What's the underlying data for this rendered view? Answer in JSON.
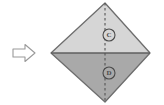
{
  "figure": {
    "background_color": "#ffffff",
    "canvas": {
      "width": 164,
      "height": 105
    }
  },
  "step_arrow": {
    "name": "step-arrow",
    "direction": "right",
    "symbol": "⇨",
    "fill_color": "#ffffff",
    "stroke_color": "#9a9a9a",
    "position": {
      "x": 12,
      "y": 44,
      "width": 24,
      "height": 18
    }
  },
  "shape": {
    "name": "diamond",
    "outline_color": "#6e6e6e",
    "vertices": {
      "top": {
        "x": 105,
        "y": 3
      },
      "left": {
        "x": 51,
        "y": 53
      },
      "right": {
        "x": 150,
        "y": 53
      },
      "bottom": {
        "x": 105,
        "y": 102
      }
    },
    "top_half": {
      "name": "upper-triangle",
      "fill_color": "#d6d6d6"
    },
    "bottom_half": {
      "name": "lower-triangle",
      "fill_color": "#a9a9a9"
    },
    "fold_line_horizontal": {
      "name": "horizontal-fold-line",
      "style": "solid",
      "color": "#5f5f5f",
      "y": 53
    },
    "fold_line_vertical": {
      "name": "vertical-center-dashed-line",
      "style": "dashed",
      "color": "#555555",
      "x": 105
    }
  },
  "markers": [
    {
      "id": "marker-upper",
      "label": "C",
      "center": {
        "x": 109,
        "y": 35
      },
      "radius": 6,
      "stroke_color": "#4a4a4a",
      "fill_color": "#d6d6d6"
    },
    {
      "id": "marker-lower",
      "label": "D",
      "center": {
        "x": 109,
        "y": 73
      },
      "radius": 6,
      "stroke_color": "#4a4a4a",
      "fill_color": "#a9a9a9"
    }
  ]
}
